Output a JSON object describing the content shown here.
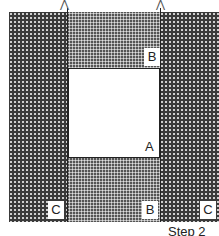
{
  "diagram": {
    "labels": {
      "a": "A",
      "b_top": "B",
      "b_bottom": "B",
      "c_left": "C",
      "c_right": "C"
    },
    "caption": "Step 2",
    "colors": {
      "fabric_dark": "#3a3a3a",
      "fabric_mid": "#555555",
      "center": "#ffffff"
    }
  }
}
